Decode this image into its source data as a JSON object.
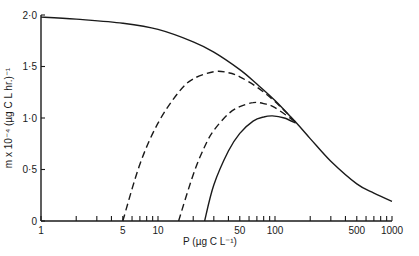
{
  "chart_data": {
    "type": "line",
    "title": "",
    "xlabel": "P (µg C L⁻¹)",
    "ylabel": "m x 10⁻⁴ (µg C L hr.)⁻¹",
    "xscale": "log",
    "xlim": [
      1,
      1000
    ],
    "ylim": [
      0,
      2.0
    ],
    "grid": false,
    "legend": "none",
    "x_tick_labels": [
      "1",
      "5",
      "10",
      "50",
      "100",
      "500",
      "1000"
    ],
    "x_tick_values": [
      1,
      5,
      10,
      50,
      100,
      500,
      1000
    ],
    "y_tick_labels": [
      "0",
      "0·5",
      "1·0",
      "1·5",
      "2·0"
    ],
    "y_tick_values": [
      0,
      0.5,
      1.0,
      1.5,
      2.0
    ],
    "series": [
      {
        "name": "main curve (solid)",
        "style": "solid",
        "x": [
          1,
          2,
          5,
          10,
          20,
          30,
          50,
          70,
          100,
          150,
          200,
          300,
          500,
          700,
          1000
        ],
        "y": [
          1.98,
          1.96,
          1.92,
          1.86,
          1.74,
          1.64,
          1.47,
          1.33,
          1.17,
          0.96,
          0.8,
          0.58,
          0.36,
          0.27,
          0.19
        ]
      },
      {
        "name": "threshold 5 (dashed)",
        "style": "dashed",
        "x": [
          5,
          7,
          10,
          15,
          20,
          30,
          40,
          50,
          70,
          100,
          150
        ],
        "y": [
          0.0,
          0.55,
          0.95,
          1.25,
          1.38,
          1.45,
          1.44,
          1.4,
          1.3,
          1.16,
          0.96
        ]
      },
      {
        "name": "threshold 15 (dashed)",
        "style": "dashed",
        "x": [
          15,
          20,
          25,
          30,
          40,
          50,
          65,
          80,
          100,
          150
        ],
        "y": [
          0.0,
          0.45,
          0.72,
          0.88,
          1.04,
          1.11,
          1.15,
          1.14,
          1.1,
          0.96
        ]
      },
      {
        "name": "threshold 25 (solid)",
        "style": "solid",
        "x": [
          25,
          30,
          40,
          50,
          65,
          80,
          95,
          120,
          150
        ],
        "y": [
          0.0,
          0.35,
          0.68,
          0.85,
          0.97,
          1.01,
          1.02,
          1.0,
          0.95
        ]
      }
    ]
  }
}
